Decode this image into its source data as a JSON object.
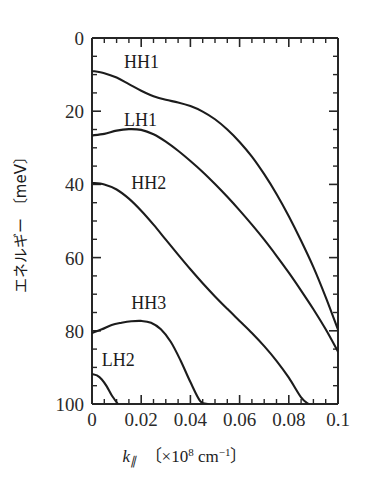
{
  "chart_data": {
    "type": "line",
    "title": "",
    "xlabel": "k∥ 〔×10⁸ cm⁻¹〕",
    "ylabel": "エネルギー 〔meV〕",
    "xlim": [
      0,
      0.1
    ],
    "ylim": [
      0,
      100
    ],
    "y_axis_inverted": true,
    "grid": false,
    "legend": "inline-annotations",
    "x_ticks": [
      "0",
      "0.02",
      "0.04",
      "0.06",
      "0.08",
      "0.1"
    ],
    "x_tick_values": [
      0,
      0.02,
      0.04,
      0.06,
      0.08,
      0.1
    ],
    "x_minor_step": 0.005,
    "y_ticks": [
      "0",
      "20",
      "40",
      "60",
      "80",
      "100"
    ],
    "y_tick_values": [
      0,
      20,
      40,
      60,
      80,
      100
    ],
    "y_minor_step": 5,
    "series": [
      {
        "name": "HH1",
        "label": "HH1",
        "x": [
          0.0,
          0.005,
          0.01,
          0.015,
          0.02,
          0.025,
          0.03,
          0.035,
          0.04,
          0.045,
          0.05,
          0.055,
          0.06,
          0.065,
          0.07,
          0.075,
          0.08,
          0.085,
          0.09,
          0.095,
          0.1
        ],
        "y": [
          9.0,
          9.6,
          10.8,
          12.6,
          14.4,
          15.9,
          16.9,
          17.6,
          18.6,
          20.1,
          22.2,
          25.0,
          28.4,
          32.4,
          37.2,
          42.6,
          48.7,
          55.4,
          62.6,
          70.8,
          79.7
        ]
      },
      {
        "name": "LH1",
        "label": "LH1",
        "x": [
          0.0,
          0.005,
          0.01,
          0.015,
          0.02,
          0.025,
          0.03,
          0.035,
          0.04,
          0.045,
          0.05,
          0.055,
          0.06,
          0.065,
          0.07,
          0.075,
          0.08,
          0.085,
          0.09,
          0.095,
          0.1
        ],
        "y": [
          26.6,
          26.2,
          25.3,
          24.9,
          25.1,
          26.3,
          28.3,
          30.8,
          33.6,
          36.6,
          39.9,
          43.4,
          47.1,
          51.0,
          55.1,
          59.5,
          64.1,
          69.0,
          74.1,
          79.6,
          85.7
        ]
      },
      {
        "name": "HH2",
        "label": "HH2",
        "x": [
          0.0,
          0.005,
          0.01,
          0.015,
          0.02,
          0.025,
          0.03,
          0.035,
          0.04,
          0.045,
          0.05,
          0.055,
          0.06,
          0.065,
          0.07,
          0.075,
          0.08,
          0.085,
          0.088
        ],
        "y": [
          39.6,
          40.0,
          41.4,
          43.9,
          47.2,
          51.0,
          55.1,
          59.2,
          63.2,
          67.0,
          70.6,
          74.0,
          77.3,
          80.6,
          84.2,
          88.2,
          92.8,
          98.2,
          100.0
        ]
      },
      {
        "name": "HH3",
        "label": "HH3",
        "x": [
          0.0,
          0.004,
          0.008,
          0.012,
          0.016,
          0.02,
          0.024,
          0.028,
          0.032,
          0.036,
          0.04,
          0.044,
          0.047
        ],
        "y": [
          80.6,
          79.6,
          78.4,
          77.8,
          77.4,
          77.3,
          77.8,
          79.6,
          83.0,
          88.1,
          94.0,
          99.2,
          100.0
        ]
      },
      {
        "name": "LH2",
        "label": "LH2",
        "x": [
          0.0,
          0.002,
          0.004,
          0.006,
          0.008,
          0.0105
        ],
        "y": [
          91.8,
          92.2,
          93.3,
          95.2,
          97.6,
          100.0
        ]
      }
    ],
    "annotations": [
      {
        "text": "HH1",
        "x": 0.013,
        "y": 6.5
      },
      {
        "text": "LH1",
        "x": 0.013,
        "y": 22.5
      },
      {
        "text": "HH2",
        "x": 0.016,
        "y": 39.5
      },
      {
        "text": "HH3",
        "x": 0.016,
        "y": 72.5
      },
      {
        "text": "LH2",
        "x": 0.004,
        "y": 88.0
      }
    ],
    "colors": {
      "curve": "#1c1c1c",
      "axis": "#262626",
      "background": "#ffffff",
      "text": "#1c1c1c"
    }
  },
  "axis_titles": {
    "x_symbol": "k",
    "x_sub": "∥",
    "x_bracket_open": "〔",
    "x_times": "×10",
    "x_exp": "8",
    "x_unit": "cm",
    "x_unit_exp": "−1",
    "x_bracket_close": "〕",
    "y_jp": "エネルギー",
    "y_bracket_open": "〔",
    "y_unit": "meV",
    "y_bracket_close": "〕"
  }
}
